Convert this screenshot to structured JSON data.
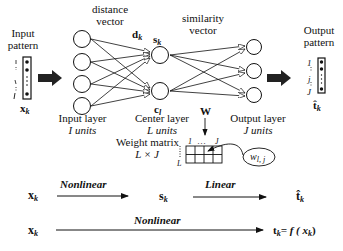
{
  "labels": {
    "input_pattern_1": "Input",
    "input_pattern_2": "pattern",
    "distance_vector_1": "distance",
    "distance_vector_2": "vector",
    "similarity_vector_1": "similarity",
    "similarity_vector_2": "vector",
    "output_pattern_1": "Output",
    "output_pattern_2": "pattern",
    "d_k": "d",
    "d_k_sub": "k",
    "s_k": "s",
    "s_k_sub": "k",
    "c_l": "c",
    "c_l_sub": "l",
    "x_k": "x",
    "x_k_sub": "k",
    "t_hat": "t̂",
    "t_hat_sub": "k",
    "W": "W",
    "input_layer": "Input layer",
    "input_units": "I  units",
    "center_layer": "Center layer",
    "center_units": "L  units",
    "output_layer": "Output layer",
    "output_units": "J units",
    "weight_matrix_1": "Weight matrix",
    "weight_matrix_2": "L × J",
    "matrix_col_1": "1",
    "matrix_col_dots": "…",
    "matrix_col_J": "J",
    "matrix_row_1": "1",
    "matrix_row_L": "L",
    "w_lj": "w",
    "w_lj_sub": "l, j",
    "in_idx_1": "I",
    "in_idx_i": "i",
    "in_idx_I": "I",
    "out_idx_1": "1",
    "out_idx_j": "j",
    "out_idx_J": "J"
  },
  "flow": {
    "row1": {
      "x": "x",
      "x_sub": "k",
      "arrow1_label": "Nonlinear",
      "s": "s",
      "s_sub": "k",
      "arrow2_label": "Linear",
      "t_hat": "t̂",
      "t_hat_sub": "k"
    },
    "row2": {
      "x": "x",
      "x_sub": "k",
      "arrow_label": "Nonlinear",
      "result": "t",
      "result_sub": "k",
      "result_eq": "= f ( x",
      "result_eq_sub": "k",
      "result_close": ")"
    }
  }
}
